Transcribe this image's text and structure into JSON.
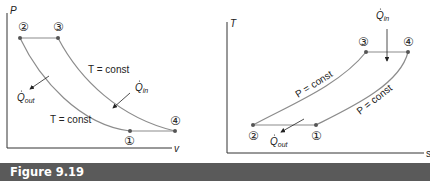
{
  "caption": {
    "label": "Figure 9.19",
    "bar_color": "#5a5a5a",
    "text_color": "#ffffff"
  },
  "pv_diagram": {
    "y_axis_label": "P",
    "x_axis_label": "v",
    "states": [
      {
        "id": "1",
        "symbol": "①"
      },
      {
        "id": "2",
        "symbol": "②"
      },
      {
        "id": "3",
        "symbol": "③"
      },
      {
        "id": "4",
        "symbol": "④"
      }
    ],
    "process_labels": {
      "upper": "T = const",
      "lower": "T = const"
    },
    "heat_in": {
      "symbol": "Q",
      "sub": "in"
    },
    "heat_out": {
      "symbol": "Q",
      "sub": "out"
    }
  },
  "ts_diagram": {
    "y_axis_label": "T",
    "x_axis_label": "s",
    "states": [
      {
        "id": "1",
        "symbol": "①"
      },
      {
        "id": "2",
        "symbol": "②"
      },
      {
        "id": "3",
        "symbol": "③"
      },
      {
        "id": "4",
        "symbol": "④"
      }
    ],
    "process_labels": {
      "upper": "P = const",
      "lower": "P = const"
    },
    "heat_in": {
      "symbol": "Q",
      "sub": "in"
    },
    "heat_out": {
      "symbol": "Q",
      "sub": "out"
    }
  },
  "colors": {
    "curve": "#8c8c8c",
    "axis": "#333333",
    "point": "#555555",
    "text": "#222222"
  }
}
